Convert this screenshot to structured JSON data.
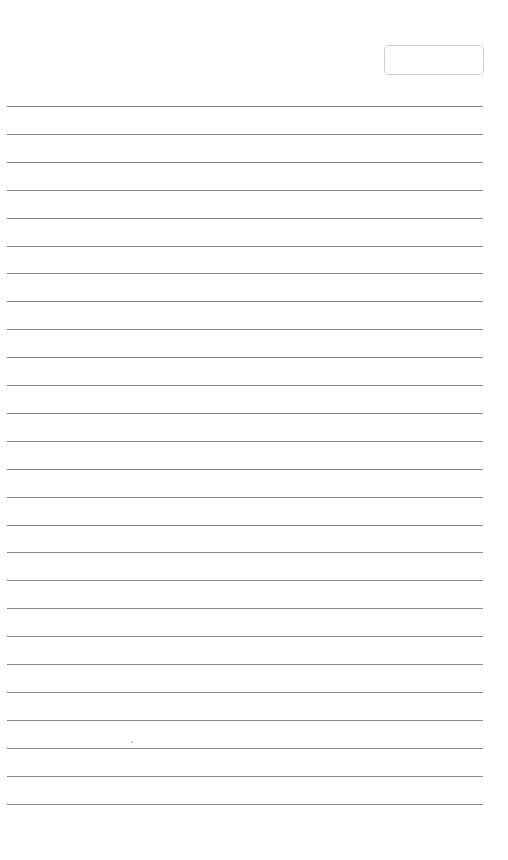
{
  "page": {
    "type": "lined-notebook-page",
    "date_box": {
      "value": ""
    },
    "line_count": 26,
    "first_line_y": 106,
    "line_spacing": 27.9,
    "line_color": "#8a8a8a",
    "background": "#ffffff"
  }
}
